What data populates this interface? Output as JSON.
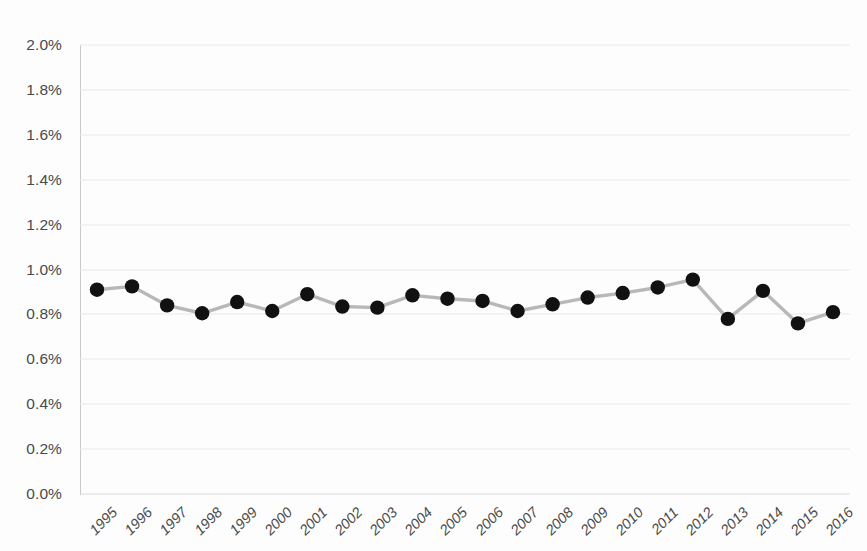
{
  "chart_data": {
    "type": "line",
    "title": "",
    "subtitle": "",
    "xlabel": "",
    "ylabel": "",
    "categories": [
      "1995",
      "1996",
      "1997",
      "1998",
      "1999",
      "2000",
      "2001",
      "2002",
      "2003",
      "2004",
      "2005",
      "2006",
      "2007",
      "2008",
      "2009",
      "2010",
      "2011",
      "2012",
      "2013",
      "2014",
      "2015",
      "2016"
    ],
    "series": [
      {
        "name": "",
        "values": [
          0.91,
          0.925,
          0.84,
          0.805,
          0.855,
          0.815,
          0.89,
          0.835,
          0.83,
          0.885,
          0.87,
          0.86,
          0.815,
          0.845,
          0.875,
          0.895,
          0.92,
          0.955,
          0.78,
          0.905,
          0.76,
          0.81
        ],
        "marker": "circle",
        "marker_color": "#111111",
        "line_color": "#b8b8b8"
      }
    ],
    "ylim": [
      0.0,
      2.0
    ],
    "y_ticks": [
      0.0,
      0.2,
      0.4,
      0.6,
      0.8,
      1.0,
      1.2,
      1.4,
      1.6,
      1.8,
      2.0
    ],
    "y_tick_labels": [
      "0.0%",
      "0.2%",
      "0.4%",
      "0.6%",
      "0.8%",
      "1.0%",
      "1.2%",
      "1.4%",
      "1.6%",
      "1.8%",
      "2.0%"
    ],
    "value_unit": "%",
    "grid": {
      "horizontal": true,
      "vertical": false,
      "color": "#e9e9ea"
    },
    "legend": {
      "visible": false,
      "position": "none",
      "entries": []
    },
    "axis_colors": {
      "y_axis_line": "#c9c9ca",
      "tick_text": "#4a4a4a"
    },
    "x_tick_rotation_deg": -45
  }
}
